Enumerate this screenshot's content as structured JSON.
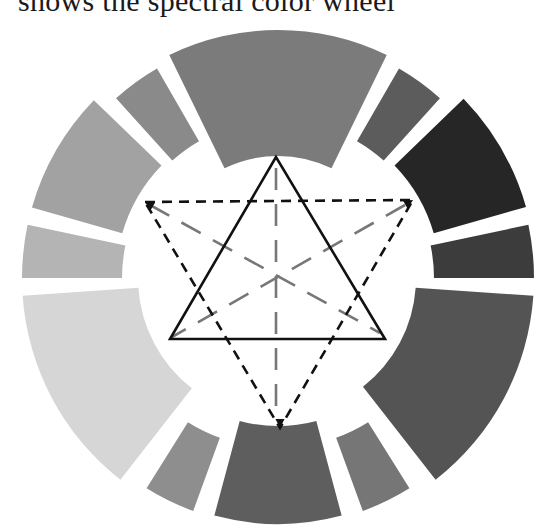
{
  "caption": {
    "text": "shows the spectral color wheel"
  },
  "wheel": {
    "center": [
      278,
      278
    ],
    "outer_radius": 250,
    "segments": [
      {
        "name": "segment-top",
        "start": -26,
        "end": 26,
        "inner": 122,
        "outer": 248,
        "color": "#7b7b7b"
      },
      {
        "name": "segment-upper-right-small",
        "start": 30,
        "end": 42,
        "inner": 158,
        "outer": 242,
        "color": "#5c5c5c"
      },
      {
        "name": "segment-right-dark",
        "start": 46,
        "end": 74,
        "inner": 162,
        "outer": 258,
        "color": "#262626"
      },
      {
        "name": "segment-right-small",
        "start": 78,
        "end": 90,
        "inner": 156,
        "outer": 256,
        "color": "#3c3c3c"
      },
      {
        "name": "segment-lower-right",
        "start": 94,
        "end": 142,
        "inner": 138,
        "outer": 256,
        "color": "#545454"
      },
      {
        "name": "segment-lower-right-small",
        "start": 148,
        "end": 160,
        "inner": 170,
        "outer": 248,
        "color": "#767676"
      },
      {
        "name": "segment-bottom",
        "start": 165,
        "end": 195,
        "inner": 148,
        "outer": 246,
        "color": "#5e5e5e"
      },
      {
        "name": "segment-lower-left-small",
        "start": 200,
        "end": 212,
        "inner": 170,
        "outer": 248,
        "color": "#8e8e8e"
      },
      {
        "name": "segment-lower-left",
        "start": 218,
        "end": 266,
        "inner": 140,
        "outer": 256,
        "color": "#d6d6d6"
      },
      {
        "name": "segment-left-small",
        "start": 270,
        "end": 282,
        "inner": 156,
        "outer": 256,
        "color": "#b4b4b4"
      },
      {
        "name": "segment-left",
        "start": 286,
        "end": 314,
        "inner": 162,
        "outer": 256,
        "color": "#a2a2a2"
      },
      {
        "name": "segment-upper-left-small",
        "start": 318,
        "end": 330,
        "inner": 158,
        "outer": 242,
        "color": "#8a8a8a"
      }
    ],
    "solid_triangle": {
      "points": [
        [
          276,
          157
        ],
        [
          170,
          339
        ],
        [
          385,
          339
        ]
      ],
      "color": "#111111"
    },
    "dashed_triangle": {
      "points": [
        [
          145,
          202
        ],
        [
          413,
          200
        ],
        [
          280,
          428
        ]
      ],
      "color": "#111111"
    },
    "gray_dashes_color": "#777777",
    "gray_lines": [
      {
        "from": [
          276,
          168
        ],
        "to": [
          276,
          410
        ]
      },
      {
        "from": [
          150,
          205
        ],
        "to": [
          380,
          333
        ]
      },
      {
        "from": [
          405,
          205
        ],
        "to": [
          172,
          337
        ]
      }
    ]
  }
}
